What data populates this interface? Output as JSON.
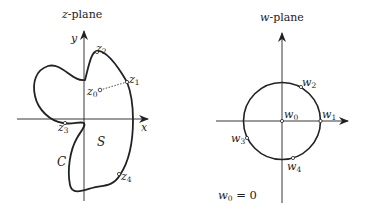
{
  "z_plane": {
    "title_var": "z",
    "title_suffix": "-plane",
    "x_axis_label": "x",
    "y_axis_label": "y",
    "curve_label": "C",
    "region_label": "S",
    "points": [
      {
        "name": "z",
        "sub": "0"
      },
      {
        "name": "z",
        "sub": "1"
      },
      {
        "name": "z",
        "sub": "2"
      },
      {
        "name": "z",
        "sub": "3"
      },
      {
        "name": "z",
        "sub": "4"
      }
    ]
  },
  "w_plane": {
    "title_var": "w",
    "title_suffix": "-plane",
    "points": [
      {
        "name": "w",
        "sub": "0"
      },
      {
        "name": "w",
        "sub": "1"
      },
      {
        "name": "w",
        "sub": "2"
      },
      {
        "name": "w",
        "sub": "3"
      },
      {
        "name": "w",
        "sub": "4"
      }
    ],
    "note_var": "w",
    "note_sub": "0",
    "note_rest": " = 0"
  },
  "colors": {
    "stroke": "#222222",
    "background": "#ffffff"
  }
}
